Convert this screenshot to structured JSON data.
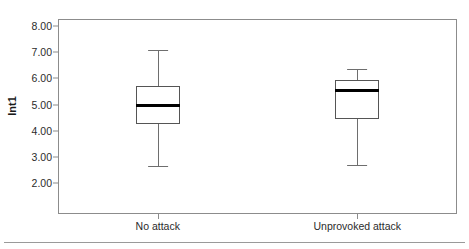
{
  "chart_data": {
    "type": "box",
    "title": "",
    "xlabel": "",
    "ylabel": "Int1",
    "ylim": [
      2.0,
      8.0
    ],
    "ytick_step": 1.0,
    "grid": false,
    "legend": "none",
    "categories": [
      "No attack",
      "Unprovoked attack"
    ],
    "ytick_labels": [
      "8.00",
      "7.00",
      "6.00",
      "5.00",
      "4.00",
      "3.00",
      "2.00"
    ],
    "ytick_values": [
      8.0,
      7.0,
      6.0,
      5.0,
      4.0,
      3.0,
      2.0
    ],
    "boxes": [
      {
        "category": "No attack",
        "whisker_high": 7.1,
        "q3": 5.7,
        "median": 4.95,
        "q1": 4.25,
        "whisker_low": 2.65
      },
      {
        "category": "Unprovoked attack",
        "whisker_high": 6.35,
        "q3": 5.95,
        "median": 5.55,
        "q1": 4.45,
        "whisker_low": 2.7
      }
    ],
    "colors": {
      "box_edge": "#555555",
      "median": "#000000",
      "whisker": "#6e6e6e",
      "frame": "#8c8c8c",
      "background": "#ffffff",
      "text": "#2b2b2b"
    }
  }
}
